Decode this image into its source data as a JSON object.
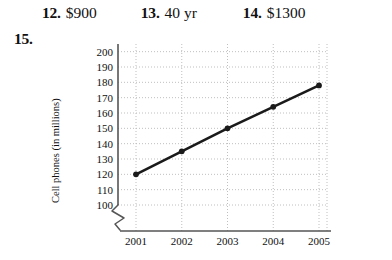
{
  "answers": [
    {
      "number": "12.",
      "value": "$900"
    },
    {
      "number": "13.",
      "value": "40 yr"
    },
    {
      "number": "14.",
      "value": "$1300"
    }
  ],
  "item15": {
    "number": "15."
  },
  "chart_data": {
    "type": "line",
    "title": "",
    "xlabel": "",
    "ylabel": "Cell phones (in millions)",
    "categories": [
      "2001",
      "2002",
      "2003",
      "2004",
      "2005"
    ],
    "x": [
      2001,
      2002,
      2003,
      2004,
      2005
    ],
    "values": [
      120,
      135,
      150,
      164,
      178
    ],
    "series": [
      {
        "name": "Cell phones",
        "values": [
          120,
          135,
          150,
          164,
          178
        ]
      }
    ],
    "ytick_labels": [
      "100",
      "110",
      "120",
      "130",
      "140",
      "150",
      "160",
      "170",
      "180",
      "190",
      "200"
    ],
    "ytick_values": [
      100,
      110,
      120,
      130,
      140,
      150,
      160,
      170,
      180,
      190,
      200
    ],
    "xtick_labels": [
      "2001",
      "2002",
      "2003",
      "2004",
      "2005"
    ],
    "ylim": [
      100,
      205
    ],
    "xlim": [
      2000.5,
      2005.5
    ],
    "grid": true,
    "grid_style": "dotted",
    "legend": false,
    "legend_position": "none",
    "axis_break": "y-axis break below 100",
    "line_color": "#1a1a1a",
    "marker": "circle",
    "marker_color": "#1a1a1a",
    "grid_color": "#b8b8b8",
    "axis_color": "#555555"
  }
}
